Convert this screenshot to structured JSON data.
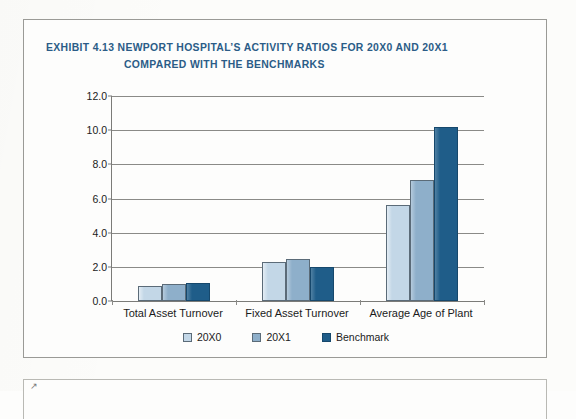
{
  "exhibit": {
    "title_line_1": "EXHIBIT 4.13  NEWPORT HOSPITAL’S ACTIVITY RATIOS FOR 20X0 AND 20X1",
    "title_line_2": "COMPARED WITH THE BENCHMARKS",
    "title_color": "#2b5c87"
  },
  "chart_data": {
    "type": "bar",
    "title": "EXHIBIT 4.13  NEWPORT HOSPITAL’S ACTIVITY RATIOS FOR 20X0 AND 20X1 COMPARED WITH THE BENCHMARKS",
    "xlabel": "",
    "ylabel": "",
    "categories": [
      "Total Asset Turnover",
      "Fixed Asset Turnover",
      "Average Age of Plant"
    ],
    "series": [
      {
        "name": "20X0",
        "color": "#c3d7e7",
        "values": [
          0.9,
          2.3,
          5.6
        ]
      },
      {
        "name": "20X1",
        "color": "#8eafca",
        "values": [
          1.0,
          2.45,
          7.1
        ]
      },
      {
        "name": "Benchmark",
        "color": "#1f5d89",
        "values": [
          1.05,
          2.0,
          10.2
        ]
      }
    ],
    "ylim": [
      0.0,
      12.0
    ],
    "ytick_step": 2.0,
    "yticks": [
      "0.0",
      "2.0",
      "4.0",
      "6.0",
      "8.0",
      "10.0",
      "12.0"
    ],
    "grid": "horizontal",
    "legend_position": "bottom-center"
  },
  "next_exhibit_marker": "↗"
}
